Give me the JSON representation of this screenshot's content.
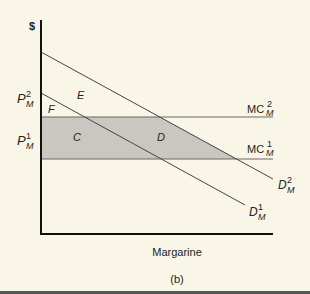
{
  "diagram": {
    "y_axis_label": "$",
    "x_axis_label": "Margarine",
    "caption": "(b)",
    "price_labels": [
      {
        "base": "P",
        "sup": "2",
        "sub": "M"
      },
      {
        "base": "P",
        "sup": "1",
        "sub": "M"
      }
    ],
    "curves": {
      "mc2": {
        "base": "MC",
        "sup": "2",
        "sub": "M"
      },
      "mc1": {
        "base": "MC",
        "sup": "1",
        "sub": "M"
      },
      "d2": {
        "base": "D",
        "sup": "2",
        "sub": "M"
      },
      "d1": {
        "base": "D",
        "sup": "1",
        "sub": "M"
      }
    },
    "regions": {
      "e": "E",
      "f": "F",
      "c": "C",
      "d": "D"
    },
    "colors": {
      "background": "#f9f6e8",
      "shaded": "#c9c7c0",
      "line": "#555555",
      "axis": "#111111"
    }
  }
}
